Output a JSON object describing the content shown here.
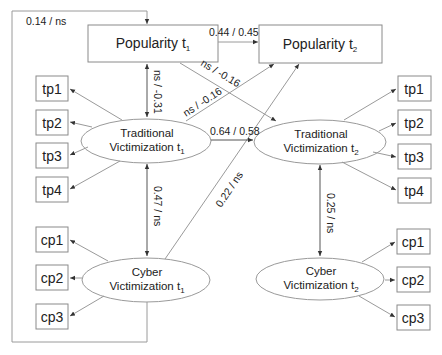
{
  "diagram": {
    "observed_t1": {
      "popularity_t1": {
        "label": "Popularity t",
        "sub": "1"
      },
      "popularity_t2": {
        "label": "Popularity t",
        "sub": "2"
      }
    },
    "latents": {
      "trad_t1": {
        "line1": "Traditional",
        "line2": "Victimization t",
        "sub": "1"
      },
      "trad_t2": {
        "line1": "Traditional",
        "line2": "Victimization t",
        "sub": "2"
      },
      "cyber_t1": {
        "line1": "Cyber",
        "line2": "Victimization t",
        "sub": "1"
      },
      "cyber_t2": {
        "line1": "Cyber",
        "line2": "Victimization t",
        "sub": "2"
      }
    },
    "indicators_left": {
      "tp": [
        "tp1",
        "tp2",
        "tp3",
        "tp4"
      ],
      "cp": [
        "cp1",
        "cp2",
        "cp3"
      ]
    },
    "indicators_right": {
      "tp": [
        "tp1",
        "tp2",
        "tp3",
        "tp4"
      ],
      "cp": [
        "cp1",
        "cp2",
        "cp3"
      ]
    },
    "coefficients": {
      "cyber_to_pop2_loop": "0.14 / ns",
      "pop1_to_pop2": "0.44 / 0.45",
      "pop1_trad1_cov": "ns / -0.31",
      "pop1_to_trad2": "ns / -0.16",
      "trad1_to_pop2": "ns / -0.16",
      "trad1_to_trad2": "0.64 / 0.58",
      "trad1_cyber1_cov": "0.47 / ns",
      "cyber1_to_pop2": "0.22 / ns",
      "trad2_cyber2_cov": "0.25 / ns"
    }
  }
}
